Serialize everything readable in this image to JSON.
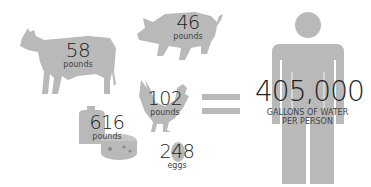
{
  "items": [
    {
      "animal": "cow",
      "value": "58",
      "unit": "pounds"
    },
    {
      "animal": "pig",
      "value": "46",
      "unit": "pounds"
    },
    {
      "animal": "chicken",
      "value": "102",
      "unit": "pounds"
    },
    {
      "animal": "dairy",
      "value": "616",
      "unit": "pounds"
    },
    {
      "animal": "egg",
      "value": "248",
      "unit": "eggs"
    }
  ],
  "equals_symbol": "=",
  "result": {
    "value": "405,000",
    "line1": "GALLONS OF WATER",
    "line2": "PER PERSON"
  },
  "colors": {
    "silhouette": "#b9b9b9",
    "text": "#222222"
  }
}
